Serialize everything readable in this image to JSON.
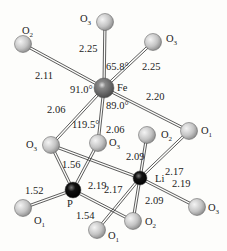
{
  "atoms": [
    {
      "id": "Fe",
      "label": "Fe",
      "x": 104,
      "y": 88,
      "r": 10,
      "kind": "Fe",
      "lx": 117,
      "ly": 91
    },
    {
      "id": "Li",
      "label": "Li",
      "x": 140,
      "y": 178,
      "r": 7,
      "kind": "Li",
      "lx": 155,
      "ly": 182
    },
    {
      "id": "P",
      "label": "P",
      "x": 73,
      "y": 190,
      "r": 8,
      "kind": "P",
      "lx": 67,
      "ly": 207
    },
    {
      "id": "O2a",
      "label": "O",
      "sub": "2",
      "x": 23,
      "y": 44,
      "r": 8.5,
      "kind": "O",
      "lx": 22,
      "ly": 34
    },
    {
      "id": "O3a",
      "label": "O",
      "sub": "3",
      "x": 105,
      "y": 22,
      "r": 8.5,
      "kind": "O",
      "lx": 80,
      "ly": 22
    },
    {
      "id": "O3b",
      "label": "O",
      "sub": "3",
      "x": 153,
      "y": 42,
      "r": 8.5,
      "kind": "O",
      "lx": 166,
      "ly": 42
    },
    {
      "id": "O1a",
      "label": "O",
      "sub": "1",
      "x": 189,
      "y": 131,
      "r": 8.5,
      "kind": "O",
      "lx": 201,
      "ly": 134
    },
    {
      "id": "O3c",
      "label": "O",
      "sub": "3",
      "x": 51,
      "y": 145,
      "r": 8.5,
      "kind": "O",
      "lx": 26,
      "ly": 148
    },
    {
      "id": "O3d",
      "label": "O",
      "sub": "3",
      "x": 98,
      "y": 143,
      "r": 8.5,
      "kind": "O",
      "lx": 109,
      "ly": 146
    },
    {
      "id": "O2b",
      "label": "O",
      "sub": "2",
      "x": 147,
      "y": 135,
      "r": 8.5,
      "kind": "O",
      "lx": 161,
      "ly": 138
    },
    {
      "id": "O3e",
      "label": "O",
      "sub": "3",
      "x": 197,
      "y": 207,
      "r": 8.5,
      "kind": "O",
      "lx": 208,
      "ly": 211
    },
    {
      "id": "O2c",
      "label": "O",
      "sub": "2",
      "x": 133,
      "y": 221,
      "r": 8.5,
      "kind": "O",
      "lx": 145,
      "ly": 225
    },
    {
      "id": "O1b",
      "label": "O",
      "sub": "1",
      "x": 23,
      "y": 208,
      "r": 8.5,
      "kind": "O",
      "lx": 34,
      "ly": 224
    },
    {
      "id": "O1c",
      "label": "O",
      "sub": "1",
      "x": 97,
      "y": 230,
      "r": 8.5,
      "kind": "O",
      "lx": 108,
      "ly": 239
    }
  ],
  "bonds": [
    [
      "Fe",
      "O2a"
    ],
    [
      "Fe",
      "O3a"
    ],
    [
      "Fe",
      "O3b"
    ],
    [
      "Fe",
      "O1a"
    ],
    [
      "Fe",
      "O3c"
    ],
    [
      "Fe",
      "O3d"
    ],
    [
      "P",
      "O3c"
    ],
    [
      "P",
      "O3d"
    ],
    [
      "P",
      "O1b"
    ],
    [
      "P",
      "O2c"
    ],
    [
      "Li",
      "O2b"
    ],
    [
      "Li",
      "O1a"
    ],
    [
      "Li",
      "O3e"
    ],
    [
      "Li",
      "O2c"
    ],
    [
      "Li",
      "O1c"
    ],
    [
      "Li",
      "O3c"
    ]
  ],
  "bond_labels": [
    {
      "text": "2.25",
      "x": 79,
      "y": 52
    },
    {
      "text": "2.11",
      "x": 35,
      "y": 79
    },
    {
      "text": "2.25",
      "x": 142,
      "y": 70
    },
    {
      "text": "2.20",
      "x": 146,
      "y": 100
    },
    {
      "text": "2.06",
      "x": 47,
      "y": 113
    },
    {
      "text": "2.06",
      "x": 106,
      "y": 133
    },
    {
      "text": "1.56",
      "x": 62,
      "y": 168
    },
    {
      "text": "2.19",
      "x": 88,
      "y": 189
    },
    {
      "text": "2.09",
      "x": 126,
      "y": 160
    },
    {
      "text": "2.17",
      "x": 165,
      "y": 175
    },
    {
      "text": "2.19",
      "x": 172,
      "y": 187
    },
    {
      "text": "2.17",
      "x": 104,
      "y": 193
    },
    {
      "text": "2.09",
      "x": 145,
      "y": 204
    },
    {
      "text": "1.52",
      "x": 25,
      "y": 194
    },
    {
      "text": "1.54",
      "x": 76,
      "y": 219
    }
  ],
  "angle_labels": [
    {
      "text": "65.8°",
      "x": 106,
      "y": 70
    },
    {
      "text": "91.0°",
      "x": 70,
      "y": 93
    },
    {
      "text": "89.0°",
      "x": 106,
      "y": 109
    },
    {
      "text": "119.5°",
      "x": 72,
      "y": 128
    }
  ],
  "colors": {
    "oxygen": "#c8c8c8",
    "iron": "#6e6e6e",
    "lithium": "#1a1a1a",
    "phosphorus": "#111111",
    "bond": "#333333",
    "text": "#222222"
  }
}
